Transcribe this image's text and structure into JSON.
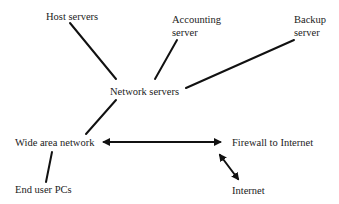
{
  "diagram": {
    "nodes": {
      "host_servers": "Host servers",
      "accounting_server_line1": "Accounting",
      "accounting_server_line2": "server",
      "backup_server_line1": "Backup",
      "backup_server_line2": "server",
      "network_servers": "Network servers",
      "wide_area_network": "Wide area network",
      "firewall": "Firewall to Internet",
      "end_user_pcs": "End user PCs",
      "internet": "Internet"
    },
    "edges": [
      {
        "from": "Host servers",
        "to": "Network servers",
        "type": "line"
      },
      {
        "from": "Accounting server",
        "to": "Network servers",
        "type": "line"
      },
      {
        "from": "Backup server",
        "to": "Network servers",
        "type": "line"
      },
      {
        "from": "Network servers",
        "to": "Wide area network",
        "type": "line"
      },
      {
        "from": "Wide area network",
        "to": "Firewall to Internet",
        "type": "double-arrow"
      },
      {
        "from": "Wide area network",
        "to": "End user PCs",
        "type": "line"
      },
      {
        "from": "Firewall to Internet",
        "to": "Internet",
        "type": "double-arrow"
      }
    ],
    "colors": {
      "line": "#111111",
      "text": "#222222",
      "background": "#ffffff"
    }
  }
}
